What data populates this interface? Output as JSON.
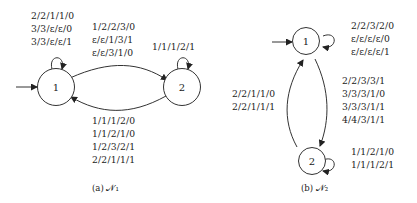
{
  "diagrams": [
    {
      "caption": "(a) 𝒩₁",
      "states": [
        {
          "id": "1",
          "initial": true
        },
        {
          "id": "2",
          "initial": false
        }
      ],
      "loop_1": [
        "2/2/1/1/0",
        "3/3/ε/ε/0",
        "3/3/ε/ε/1"
      ],
      "edge_1_to_2": [
        "1/2/2/3/0",
        "ε/ε/1/3/1",
        "ε/ε/3/1/0"
      ],
      "loop_2": [
        "1/1/1/2/1"
      ],
      "edge_2_to_1": [
        "1/1/1/2/0",
        "1/1/2/1/0",
        "1/2/3/2/1",
        "2/2/1/1/1"
      ]
    },
    {
      "caption": "(b) 𝒩₂",
      "states": [
        {
          "id": "1",
          "initial": true
        },
        {
          "id": "2",
          "initial": false
        }
      ],
      "loop_1": [
        "2/2/3/2/0",
        "ε/ε/ε/ε/0",
        "ε/ε/ε/ε/1"
      ],
      "edge_1_to_2": [
        "2/2/3/3/1",
        "3/3/3/1/0",
        "3/3/3/1/1",
        "4/4/3/1/1"
      ],
      "edge_2_to_1": [
        "2/2/1/1/0",
        "2/2/1/1/1"
      ],
      "loop_2": [
        "1/1/2/1/0",
        "1/1/1/2/1"
      ]
    }
  ]
}
